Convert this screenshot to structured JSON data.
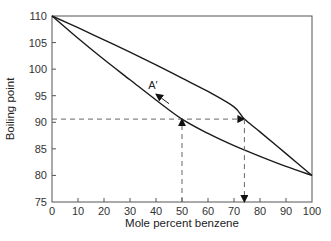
{
  "chart_data": {
    "type": "line",
    "title": "",
    "xlabel": "Mole percent benzene",
    "ylabel": "Boiling point",
    "xlim": [
      0,
      100
    ],
    "ylim": [
      75,
      110
    ],
    "xticks": [
      0,
      10,
      20,
      30,
      40,
      50,
      60,
      70,
      80,
      90,
      100
    ],
    "yticks": [
      75,
      80,
      85,
      90,
      95,
      100,
      105,
      110
    ],
    "grid": false,
    "legend": null,
    "series": [
      {
        "name": "Vapor curve (upper)",
        "x": [
          0,
          10,
          20,
          30,
          40,
          50,
          60,
          70,
          74,
          80,
          90,
          100
        ],
        "y": [
          110,
          107.8,
          105.5,
          103.2,
          100.8,
          98.3,
          95.8,
          92.9,
          90.6,
          88.2,
          84.1,
          80
        ]
      },
      {
        "name": "Liquid curve (lower)",
        "x": [
          0,
          10,
          20,
          30,
          40,
          50,
          60,
          70,
          80,
          90,
          100
        ],
        "y": [
          110,
          105.8,
          101.8,
          98.0,
          94.2,
          90.6,
          87.9,
          85.6,
          83.6,
          81.7,
          80
        ]
      }
    ],
    "annotations": [
      {
        "type": "dashed-line",
        "from": [
          0,
          90.6
        ],
        "to": [
          74,
          90.6
        ],
        "arrow_end": true
      },
      {
        "type": "dashed-line",
        "from": [
          50,
          75
        ],
        "to": [
          50,
          90.6
        ],
        "arrow_end": true
      },
      {
        "type": "dashed-line",
        "from": [
          74,
          90.6
        ],
        "to": [
          74,
          75
        ],
        "arrow_end": true
      },
      {
        "type": "arrow",
        "from": [
          45,
          93.5
        ],
        "to": [
          40,
          95.3
        ]
      },
      {
        "type": "text",
        "text": "A′",
        "x": 37,
        "y": 96.2
      }
    ]
  },
  "labels": {
    "xlabel": "Mole percent benzene",
    "ylabel": "Boiling point",
    "annotation": "A′"
  }
}
